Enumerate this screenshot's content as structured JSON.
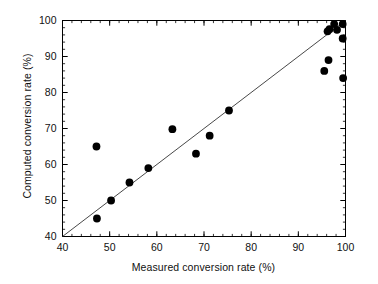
{
  "chart_data": {
    "type": "scatter",
    "title": "",
    "xlabel": "Measured conversion rate (%)",
    "ylabel": "Computed conversion rate (%)",
    "xlim": [
      40,
      100
    ],
    "ylim": [
      40,
      100
    ],
    "xticks": [
      40,
      50,
      60,
      70,
      80,
      90,
      100
    ],
    "xtick_labels": [
      "40",
      "50",
      "60",
      "70",
      "80",
      "90",
      "100"
    ],
    "yticks": [
      40,
      50,
      60,
      70,
      80,
      90,
      100
    ],
    "ytick_labels": [
      "40",
      "50",
      "60",
      "70",
      "80",
      "90",
      "100"
    ],
    "minor_tick_interval": 2,
    "grid": false,
    "legend": null,
    "marker": "filled-circle",
    "marker_color": "#000000",
    "marker_size_px": 5.2,
    "series": [
      {
        "name": "samples",
        "points": [
          [
            47.3,
            45.0
          ],
          [
            47.2,
            65.0
          ],
          [
            50.3,
            50.0
          ],
          [
            54.2,
            55.0
          ],
          [
            58.2,
            59.0
          ],
          [
            63.3,
            69.8
          ],
          [
            68.3,
            63.0
          ],
          [
            71.2,
            68.0
          ],
          [
            75.3,
            75.0
          ],
          [
            95.5,
            86.0
          ],
          [
            96.4,
            89.0
          ],
          [
            96.2,
            97.0
          ],
          [
            96.6,
            97.6
          ],
          [
            97.6,
            99.0
          ],
          [
            98.2,
            97.4
          ],
          [
            99.4,
            99.0
          ],
          [
            99.4,
            95.0
          ],
          [
            99.5,
            84.0
          ]
        ]
      }
    ],
    "reference_line": {
      "name": "identity-line",
      "type": "line",
      "from": [
        40,
        40
      ],
      "to": [
        100,
        100
      ],
      "color": "#333333",
      "width_px": 0.9
    }
  },
  "axes": {
    "frame_color": "#000000",
    "tick_color": "#000000"
  }
}
